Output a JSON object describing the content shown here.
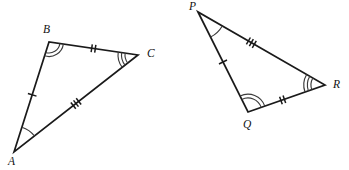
{
  "figure": {
    "background_color": "#ffffff",
    "stroke_color": "#1a1a1a",
    "arc_color": "#3b3b3b",
    "width": 349,
    "height": 170
  },
  "triangles": [
    {
      "id": "ABC",
      "name": "triangle-abc",
      "vertices": [
        {
          "label": "A",
          "name": "vertex-a",
          "x": 14,
          "y": 152,
          "label_x": 8,
          "label_y": 165,
          "arcs": 1,
          "arc_radius": 26,
          "arc_gap": 4
        },
        {
          "label": "B",
          "name": "vertex-b",
          "x": 49,
          "y": 42,
          "label_x": 43,
          "label_y": 33,
          "arcs": 2,
          "arc_radius": 11,
          "arc_gap": 3.5
        },
        {
          "label": "C",
          "name": "vertex-c",
          "x": 138,
          "y": 55,
          "label_x": 147,
          "label_y": 57,
          "arcs": 3,
          "arc_radius": 13,
          "arc_gap": 3.5
        }
      ],
      "sides": [
        {
          "name": "side-ab",
          "from": "A",
          "to": "B",
          "ticks": 1,
          "tick_position": 0.52,
          "tick_length": 9,
          "tick_spacing": 3.6
        },
        {
          "name": "side-bc",
          "from": "B",
          "to": "C",
          "ticks": 2,
          "tick_position": 0.5,
          "tick_length": 8,
          "tick_spacing": 3.6
        },
        {
          "name": "side-ac",
          "from": "A",
          "to": "C",
          "ticks": 3,
          "tick_position": 0.5,
          "tick_length": 8,
          "tick_spacing": 3.4
        }
      ]
    },
    {
      "id": "PQR",
      "name": "triangle-pqr",
      "vertices": [
        {
          "label": "P",
          "name": "vertex-p",
          "x": 198,
          "y": 12,
          "label_x": 189,
          "label_y": 10,
          "arcs": 1,
          "arc_radius": 28,
          "arc_gap": 4
        },
        {
          "label": "Q",
          "name": "vertex-q",
          "x": 248,
          "y": 112,
          "label_x": 243,
          "label_y": 128,
          "arcs": 2,
          "arc_radius": 14,
          "arc_gap": 3.8
        },
        {
          "label": "R",
          "name": "vertex-r",
          "x": 325,
          "y": 85,
          "label_x": 333,
          "label_y": 88,
          "arcs": 3,
          "arc_radius": 14,
          "arc_gap": 3.6
        }
      ],
      "sides": [
        {
          "name": "side-pq",
          "from": "P",
          "to": "Q",
          "ticks": 1,
          "tick_position": 0.5,
          "tick_length": 9,
          "tick_spacing": 3.6
        },
        {
          "name": "side-qr",
          "from": "Q",
          "to": "R",
          "ticks": 2,
          "tick_position": 0.45,
          "tick_length": 8,
          "tick_spacing": 3.6
        },
        {
          "name": "side-pr",
          "from": "P",
          "to": "R",
          "ticks": 3,
          "tick_position": 0.42,
          "tick_length": 8,
          "tick_spacing": 3.4
        }
      ]
    }
  ]
}
